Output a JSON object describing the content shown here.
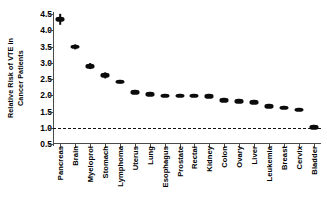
{
  "chart_data": {
    "type": "scatter",
    "title": "",
    "xlabel": "",
    "ylabel": "Relative Risk of VTE in Cancer Patients",
    "ylabel_lines": [
      "Relative Risk of VTE in",
      "Cancer Patients"
    ],
    "ylim": [
      0.5,
      4.5
    ],
    "yticks": [
      4.5,
      4.0,
      3.5,
      3.0,
      2.5,
      2.0,
      1.5,
      1.0,
      0.5
    ],
    "ytick_labels": [
      "4.5",
      "4.0",
      "3.5",
      "3.0",
      "2.5",
      "2.0",
      "1.5",
      "1.0",
      "0.5"
    ],
    "grid": false,
    "legend": false,
    "reference_line": {
      "value": 1.0,
      "style": "dashed",
      "color": "#111111"
    },
    "marker_color": "#0b0b0b",
    "axis_color": "#4a4a4a",
    "background": "#ffffff",
    "categories": [
      "Pancreas",
      "Brain",
      "Myeloprol",
      "Stomach",
      "Lymphoma",
      "Uterus",
      "Lung",
      "Esophagus",
      "Prostate",
      "Rectal",
      "Kidney",
      "Colon",
      "Ovary",
      "Liver",
      "Leukemia",
      "Breast",
      "Cervix",
      "Bladder"
    ],
    "values": [
      4.34,
      3.5,
      2.89,
      2.61,
      2.42,
      2.1,
      2.03,
      1.99,
      1.99,
      1.99,
      1.97,
      1.85,
      1.82,
      1.78,
      1.66,
      1.61,
      1.55,
      1.01
    ],
    "error_low": [
      4.18,
      3.42,
      2.8,
      2.53,
      2.37,
      2.05,
      1.99,
      1.95,
      1.96,
      1.96,
      1.94,
      1.82,
      1.79,
      1.75,
      1.63,
      1.58,
      1.52,
      0.97
    ],
    "error_high": [
      4.5,
      3.58,
      2.98,
      2.69,
      2.47,
      2.15,
      2.07,
      2.03,
      2.02,
      2.02,
      2.0,
      1.88,
      1.85,
      1.81,
      1.69,
      1.64,
      1.58,
      1.05
    ]
  }
}
